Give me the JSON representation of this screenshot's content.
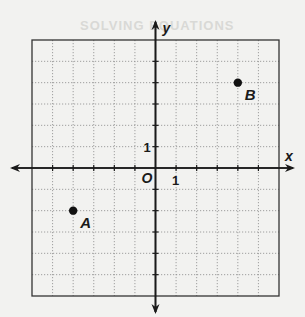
{
  "figure": {
    "type": "coordinate-plane",
    "grid": {
      "x_min": -6,
      "x_max": 6,
      "y_min": -6,
      "y_max": 6,
      "step": 1,
      "style": "dotted"
    },
    "axes": {
      "x_label": "x",
      "y_label": "y",
      "origin_label": "O",
      "x_tick_label": "1",
      "y_tick_label": "1"
    },
    "points": [
      {
        "name": "A",
        "x": -4,
        "y": -2
      },
      {
        "name": "B",
        "x": 4,
        "y": 4
      }
    ],
    "colors": {
      "line": "#1a1a1a",
      "grid": "#8a8a8a",
      "background": "#f2f2f0",
      "point": "#111111"
    }
  },
  "bleed_through_text": "SOLVING EQUATIONS"
}
